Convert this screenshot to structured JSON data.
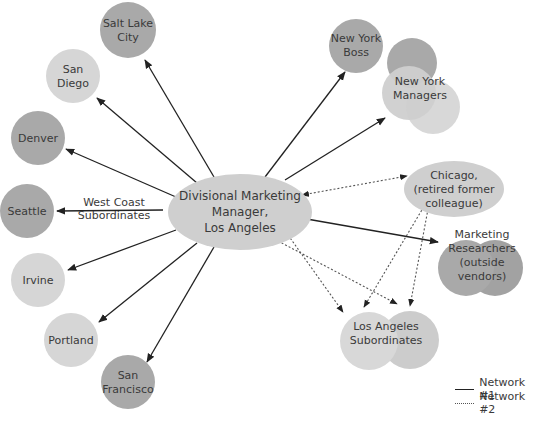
{
  "colors": {
    "dark_node": "#a9a9a9",
    "light_node": "#d6d6d6",
    "center_node": "#cfcfcf",
    "solid_edge": "#222222",
    "dotted_edge": "#555555",
    "text": "#3a3a3a"
  },
  "center": {
    "label": "Divisional Marketing\nManager,\nLos Angeles"
  },
  "nodes": [
    {
      "id": "salt-lake-city",
      "label": "Salt Lake\nCity",
      "shade": "dark"
    },
    {
      "id": "san-diego",
      "label": "San\nDiego",
      "shade": "light"
    },
    {
      "id": "denver",
      "label": "Denver",
      "shade": "dark"
    },
    {
      "id": "seattle",
      "label": "Seattle",
      "shade": "dark"
    },
    {
      "id": "irvine",
      "label": "Irvine",
      "shade": "light"
    },
    {
      "id": "portland",
      "label": "Portland",
      "shade": "light"
    },
    {
      "id": "san-francisco",
      "label": "San\nFrancisco",
      "shade": "dark"
    },
    {
      "id": "new-york-boss",
      "label": "New York\nBoss",
      "shade": "dark"
    },
    {
      "id": "new-york-managers",
      "label": "New York\nManagers",
      "shade": "mixed"
    },
    {
      "id": "chicago",
      "label": "Chicago,\n(retired former\ncolleague)",
      "shade": "light"
    },
    {
      "id": "marketing-researchers",
      "label": "Marketing\nResearchers\n(outside vendors)",
      "shade": "dark"
    },
    {
      "id": "la-subordinates",
      "label": "Los Angeles\nSubordinates",
      "shade": "light"
    }
  ],
  "edge_label": "West Coast\nSubordinates",
  "edges": [
    {
      "from": "center",
      "to": "salt-lake-city",
      "network": 1
    },
    {
      "from": "center",
      "to": "san-diego",
      "network": 1
    },
    {
      "from": "center",
      "to": "denver",
      "network": 1
    },
    {
      "from": "center",
      "to": "seattle",
      "network": 1
    },
    {
      "from": "center",
      "to": "irvine",
      "network": 1
    },
    {
      "from": "center",
      "to": "portland",
      "network": 1
    },
    {
      "from": "center",
      "to": "san-francisco",
      "network": 1
    },
    {
      "from": "center",
      "to": "new-york-boss",
      "network": 1
    },
    {
      "from": "center",
      "to": "new-york-managers",
      "network": 1
    },
    {
      "from": "center",
      "to": "marketing-researchers",
      "network": 1
    },
    {
      "from": "center",
      "to": "chicago",
      "network": 2,
      "bidirectional": true
    },
    {
      "from": "center",
      "to": "la-subordinates",
      "network": 2
    },
    {
      "from": "chicago",
      "to": "la-subordinates",
      "network": 2
    }
  ],
  "legend": {
    "network1": "Network #1",
    "network2": "Network #2"
  }
}
